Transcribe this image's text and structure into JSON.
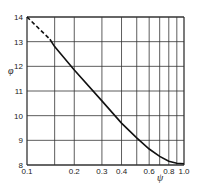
{
  "chart_data": {
    "type": "line",
    "title": "",
    "xlabel": "ψ",
    "ylabel": "φ",
    "xscale": "log",
    "xlim": [
      0.1,
      1.0
    ],
    "ylim": [
      8,
      14
    ],
    "grid": true,
    "x_ticks": [
      "0.1",
      "0.2",
      "0.3",
      "0.4",
      "0.6",
      "0.8",
      "1.0"
    ],
    "x_gridlines": [
      0.1,
      0.15,
      0.2,
      0.3,
      0.4,
      0.5,
      0.6,
      0.7,
      0.8,
      0.9,
      1.0
    ],
    "y_ticks": [
      "8",
      "9",
      "10",
      "11",
      "12",
      "13",
      "14"
    ],
    "series": [
      {
        "name": "extrapolated",
        "style": "dashed",
        "x": [
          0.1,
          0.14
        ],
        "y": [
          14.0,
          13.1
        ]
      },
      {
        "name": "curve",
        "style": "solid",
        "x": [
          0.14,
          0.15,
          0.2,
          0.3,
          0.4,
          0.5,
          0.6,
          0.7,
          0.8,
          0.9,
          1.0
        ],
        "y": [
          13.1,
          12.8,
          11.85,
          10.6,
          9.7,
          9.1,
          8.65,
          8.35,
          8.15,
          8.07,
          8.05
        ]
      }
    ]
  }
}
